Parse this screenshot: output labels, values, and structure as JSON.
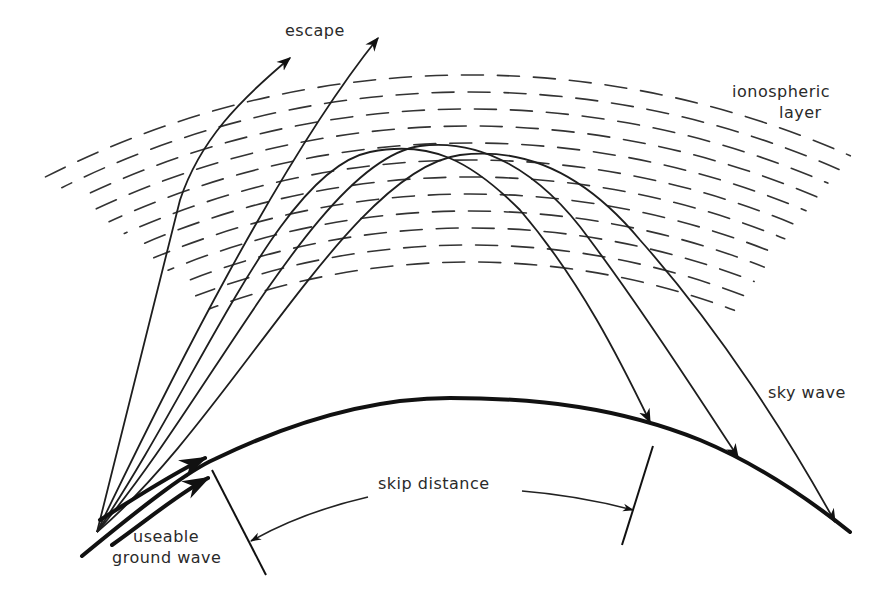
{
  "diagram": {
    "colors": {
      "ink": "#1e1e1e",
      "background": "#ffffff"
    },
    "labels": {
      "escape": "escape",
      "ionospheric_layer_line1": "ionospheric",
      "ionospheric_layer_line2": "layer",
      "sky_wave": "sky wave",
      "skip_distance": "skip distance",
      "useable_line1": "useable",
      "ground_wave_line2": "ground wave"
    },
    "elements": {
      "escape_rays": 2,
      "sky_wave_rays": 3,
      "ground_wave_arrows": 2,
      "ionosphere_dash_rows": 12
    }
  }
}
